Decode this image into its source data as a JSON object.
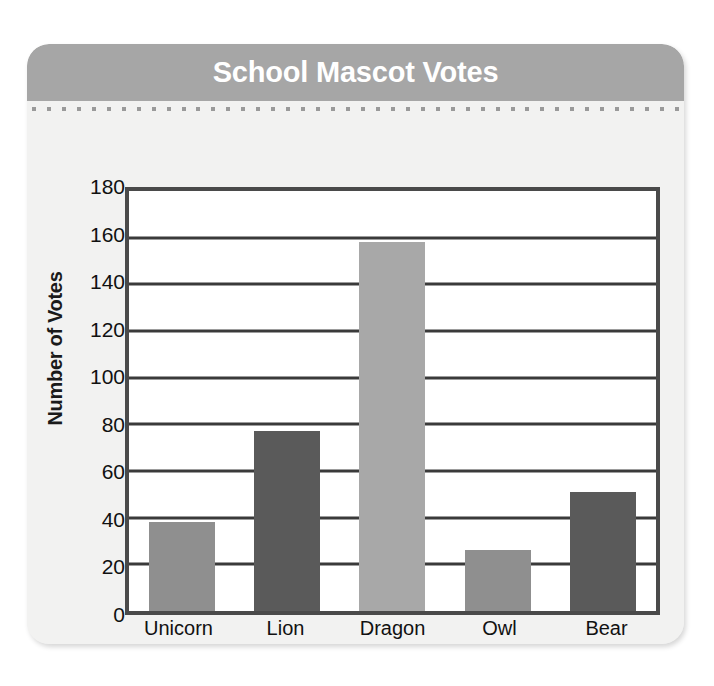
{
  "card": {
    "title": "School Mascot Votes",
    "header_color": "#a6a6a6",
    "background_color": "#f2f2f1",
    "dot_color": "#9a9a9a",
    "dot_count": 44
  },
  "chart_data": {
    "type": "bar",
    "title": "School Mascot Votes",
    "xlabel": "Mascot",
    "ylabel": "Number of Votes",
    "categories": [
      "Unicorn",
      "Lion",
      "Dragon",
      "Owl",
      "Bear"
    ],
    "values": [
      38,
      77,
      158,
      26,
      51
    ],
    "bar_colors": [
      "#8f8f8f",
      "#5a5a5a",
      "#a8a8a8",
      "#8f8f8f",
      "#5a5a5a"
    ],
    "ylim": [
      0,
      180
    ],
    "yticks": [
      0,
      20,
      40,
      60,
      80,
      100,
      120,
      140,
      160,
      180
    ],
    "ytick_labels": [
      "0",
      "20",
      "40",
      "60",
      "80",
      "100",
      "120",
      "140",
      "160",
      "180"
    ],
    "grid": true,
    "grid_color": "#3a3a3a",
    "legend": "none",
    "plot_border_color": "#4a4a4a",
    "plot_background": "#ffffff"
  }
}
